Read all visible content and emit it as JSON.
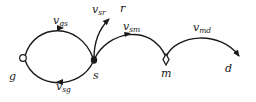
{
  "diagram": {
    "nodes": {
      "g": {
        "label": "g",
        "shape": "open-circle"
      },
      "s": {
        "label": "s",
        "shape": "filled-circle"
      },
      "m": {
        "label": "m",
        "shape": "diamond"
      },
      "r": {
        "label": "r",
        "shape": "none"
      },
      "d": {
        "label": "d",
        "shape": "none"
      }
    },
    "edges": {
      "gs": {
        "base": "v",
        "sub": "gs",
        "from": "g",
        "to": "s"
      },
      "sg": {
        "base": "v",
        "sub": "sg",
        "from": "s",
        "to": "g"
      },
      "sr": {
        "base": "v",
        "sub": "sr",
        "from": "s",
        "to": "r"
      },
      "sm": {
        "base": "v",
        "sub": "sm",
        "from": "s",
        "to": "m"
      },
      "md": {
        "base": "v",
        "sub": "md",
        "from": "m",
        "to": "d"
      }
    },
    "colors": {
      "stroke": "#1a1a1a",
      "background": "#ffffff"
    }
  }
}
